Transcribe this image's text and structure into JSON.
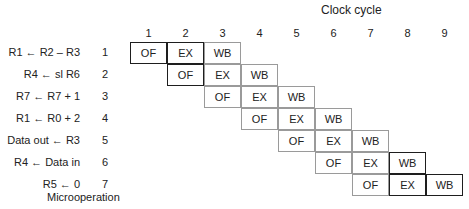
{
  "title": "Clock cycle",
  "xlabel_bottom": "Microoperation",
  "clock_cycles": [
    "1",
    "2",
    "3",
    "4",
    "5",
    "6",
    "7",
    "8",
    "9"
  ],
  "microoperations": [
    {
      "num": "1",
      "text": "R1 ← R2 – R3"
    },
    {
      "num": "2",
      "text": "R4 ← sl R6"
    },
    {
      "num": "3",
      "text": "R7 ← R7 + 1"
    },
    {
      "num": "4",
      "text": "R1 ← R0 + 2"
    },
    {
      "num": "5",
      "text": "Data out ← R3"
    },
    {
      "num": "6",
      "text": "R4 ← Data in"
    },
    {
      "num": "7",
      "text": "R5 ← 0"
    }
  ],
  "stages": [
    "OF",
    "EX",
    "WB"
  ],
  "colors": {
    "dark_border": "#1e1e1e",
    "gray_border": "#9a9a9a",
    "text": "#222222"
  }
}
